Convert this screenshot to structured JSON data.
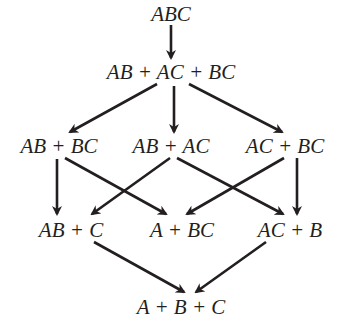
{
  "diagram": {
    "type": "lattice",
    "nodes": {
      "top": {
        "id": "abc",
        "label": "ABC",
        "x": 171,
        "y": 14
      },
      "l1": {
        "id": "ab_ac_bc",
        "label": "AB + AC + BC",
        "x": 171,
        "y": 72
      },
      "l2_0": {
        "id": "ab_bc",
        "label": "AB + BC",
        "x": 59,
        "y": 146
      },
      "l2_1": {
        "id": "ab_ac",
        "label": "AB + AC",
        "x": 171,
        "y": 146
      },
      "l2_2": {
        "id": "ac_bc",
        "label": "AC + BC",
        "x": 285,
        "y": 146
      },
      "l3_0": {
        "id": "ab_c",
        "label": "AB + C",
        "x": 71,
        "y": 230
      },
      "l3_1": {
        "id": "a_bc",
        "label": "A + BC",
        "x": 182,
        "y": 230
      },
      "l3_2": {
        "id": "ac_b",
        "label": "AC + B",
        "x": 290,
        "y": 230
      },
      "bottom": {
        "id": "a_b_c",
        "label": "A + B + C",
        "x": 181,
        "y": 307
      }
    },
    "edges": [
      {
        "from": "ABC",
        "to": "AB + AC + BC",
        "x1": 171,
        "y1": 25,
        "x2": 171,
        "y2": 58
      },
      {
        "from": "AB + AC + BC",
        "to": "AB + BC",
        "x1": 157,
        "y1": 84,
        "x2": 70,
        "y2": 132
      },
      {
        "from": "AB + AC + BC",
        "to": "AB + AC",
        "x1": 174,
        "y1": 86,
        "x2": 174,
        "y2": 132
      },
      {
        "from": "AB + AC + BC",
        "to": "AC + BC",
        "x1": 189,
        "y1": 84,
        "x2": 282,
        "y2": 132
      },
      {
        "from": "AB + BC",
        "to": "AB + C",
        "x1": 57,
        "y1": 159,
        "x2": 57,
        "y2": 214
      },
      {
        "from": "AB + BC",
        "to": "A + BC",
        "x1": 65,
        "y1": 158,
        "x2": 166,
        "y2": 214
      },
      {
        "from": "AB + AC",
        "to": "AB + C",
        "x1": 170,
        "y1": 158,
        "x2": 92,
        "y2": 214
      },
      {
        "from": "AB + AC",
        "to": "A + BC",
        "x1": 177,
        "y1": 158,
        "x2": 283,
        "y2": 214
      },
      {
        "from": "AC + BC",
        "to": "A + BC",
        "x1": 284,
        "y1": 158,
        "x2": 187,
        "y2": 214
      },
      {
        "from": "AC + BC",
        "to": "AC + B",
        "x1": 297,
        "y1": 158,
        "x2": 297,
        "y2": 214
      },
      {
        "from": "AB + C",
        "to": "A + B + C",
        "x1": 94,
        "y1": 242,
        "x2": 184,
        "y2": 292
      },
      {
        "from": "AC + B",
        "to": "A + B + C",
        "x1": 266,
        "y1": 242,
        "x2": 196,
        "y2": 292
      }
    ],
    "colors": {
      "stroke": "#231f20",
      "text": "#231f20",
      "background": "#ffffff"
    }
  }
}
